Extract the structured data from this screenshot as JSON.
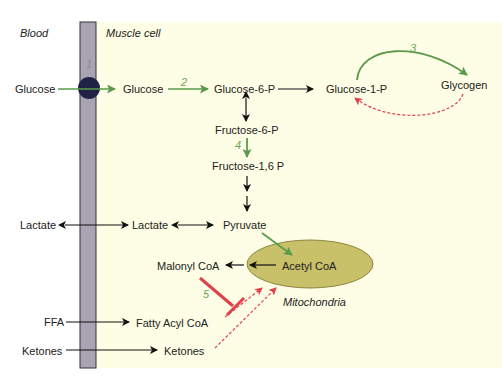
{
  "regions": {
    "blood": "Blood",
    "muscle_cell": "Muscle cell",
    "mitochondria": "Mitochondria"
  },
  "metabolites": {
    "glucose_blood": "Glucose",
    "glucose_cell": "Glucose",
    "glucose_6p": "Glucose-6-P",
    "glucose_1p": "Glucose-1-P",
    "glycogen": "Glycogen",
    "fructose_6p": "Fructose-6-P",
    "fructose_16p": "Fructose-1,6 P",
    "lactate_blood": "Lactate",
    "lactate_cell": "Lactate",
    "pyruvate": "Pyruvate",
    "malonyl_coa": "Malonyl CoA",
    "acetyl_coa": "Acetyl CoA",
    "ffa": "FFA",
    "fatty_acyl_coa": "Fatty Acyl CoA",
    "ketones_blood": "Ketones",
    "ketones_cell": "Ketones"
  },
  "step_numbers": {
    "s1": "1",
    "s2": "2",
    "s3": "3",
    "s4": "4",
    "s5": "5"
  },
  "colors": {
    "membrane": "#a9a3b3",
    "transporter": "#1f2244",
    "cell_background": "#fefee6",
    "mitochondria_fill": "#c9c06a",
    "green_arrow": "#5a9a4a",
    "red_arrow": "#e0404a",
    "black_arrow": "#111111"
  }
}
